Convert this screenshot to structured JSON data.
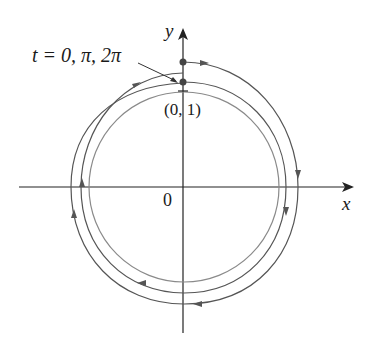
{
  "figure": {
    "type": "parametric-curve-diagram",
    "axes": {
      "x_label": "x",
      "y_label": "y",
      "origin_label": "0"
    },
    "annotations": {
      "parameter_label": "t = 0, π, 2π",
      "point_label": "(0, 1)"
    },
    "curves": [
      {
        "name": "unit-circle",
        "color": "#8a8a8a"
      },
      {
        "name": "spiral-path",
        "color": "#555555",
        "direction": "clockwise"
      }
    ],
    "colors": {
      "axes": "#222222",
      "dots": "#444444"
    }
  }
}
